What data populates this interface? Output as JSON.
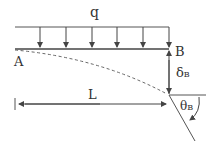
{
  "diagram": {
    "labels": {
      "load": "q",
      "fixed_end": "A",
      "free_end": "B",
      "deflection_symbol": "δ",
      "deflection_sub": "B",
      "length": "L",
      "rotation_symbol": "θ",
      "rotation_sub": "B"
    },
    "load_arrow_count": 6,
    "colors": {
      "line": "#444444",
      "text": "#333333",
      "dashed": "#666666"
    }
  }
}
